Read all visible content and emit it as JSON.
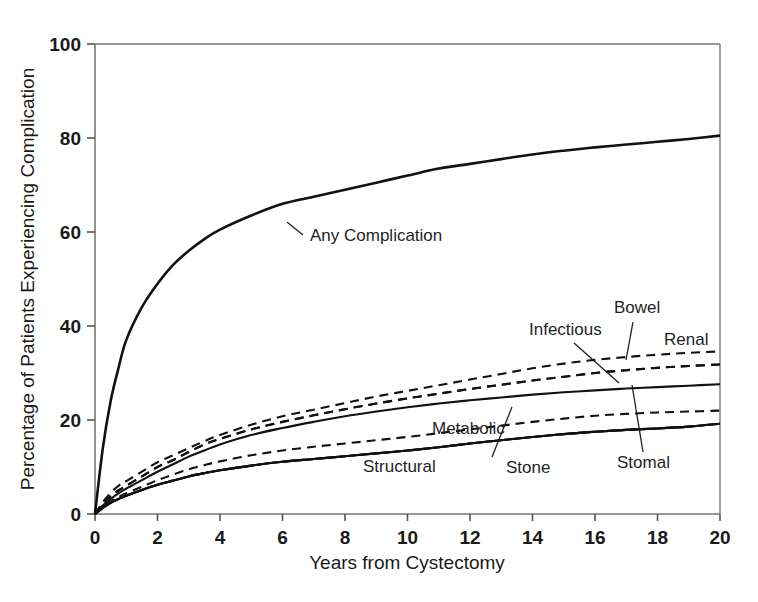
{
  "chart_data": {
    "type": "line",
    "title": "",
    "xlabel": "Years from Cystectomy",
    "ylabel": "Percentage of Patients Experiencing Complication",
    "xlim": [
      0,
      20
    ],
    "ylim": [
      0,
      100
    ],
    "xticks": [
      0,
      2,
      4,
      6,
      8,
      10,
      12,
      14,
      16,
      18,
      20
    ],
    "yticks": [
      0,
      20,
      40,
      60,
      80,
      100
    ],
    "grid": false,
    "legend": "inline-annotations",
    "x": [
      0,
      0.25,
      0.5,
      0.75,
      1,
      1.5,
      2,
      2.5,
      3,
      3.5,
      4,
      5,
      6,
      7,
      8,
      9,
      10,
      11,
      12,
      13,
      14,
      15,
      16,
      17,
      18,
      19,
      20
    ],
    "series": [
      {
        "name": "Any Complication",
        "style": "solid",
        "label": "Any Complication",
        "values": [
          0,
          14,
          24,
          31,
          37,
          44,
          49,
          53,
          56,
          58.5,
          60.5,
          63.5,
          66,
          67.5,
          69,
          70.5,
          72,
          73.5,
          74.5,
          75.5,
          76.5,
          77.3,
          78,
          78.6,
          79.2,
          79.8,
          80.5
        ]
      },
      {
        "name": "Infectious",
        "style": "dashed",
        "label": "Infectious",
        "values": [
          0,
          2.5,
          4.5,
          6,
          7,
          9,
          11,
          12.5,
          14,
          15.5,
          16.8,
          19,
          20.8,
          22.2,
          23.6,
          25,
          26.2,
          27.4,
          28.6,
          29.8,
          31,
          32,
          32.8,
          33.4,
          33.9,
          34.3,
          34.6
        ]
      },
      {
        "name": "Bowel",
        "style": "dashed",
        "label": "Bowel",
        "values": [
          0,
          2.2,
          3.8,
          5,
          6,
          8,
          10,
          11.5,
          13.2,
          14.8,
          16,
          18,
          19.6,
          21,
          22.3,
          23.5,
          24.6,
          25.6,
          26.6,
          27.5,
          28.4,
          29.2,
          30,
          30.6,
          31.1,
          31.5,
          31.8
        ]
      },
      {
        "name": "Renal",
        "style": "dashed",
        "label": "Renal",
        "values": [
          0,
          2.2,
          3.8,
          5,
          6,
          8,
          10,
          11.5,
          13.2,
          14.8,
          16,
          18,
          19.6,
          21,
          22.3,
          23.5,
          24.6,
          25.6,
          26.6,
          27.5,
          28.4,
          29.2,
          30,
          30.6,
          31.1,
          31.5,
          31.8
        ]
      },
      {
        "name": "Infectious-solid",
        "style": "solid",
        "label": "",
        "values": [
          0,
          1.8,
          3.2,
          4.4,
          5.4,
          7.2,
          9,
          10.6,
          12.2,
          13.5,
          14.8,
          16.8,
          18.3,
          19.6,
          20.8,
          21.8,
          22.7,
          23.5,
          24.2,
          24.8,
          25.4,
          25.9,
          26.3,
          26.7,
          27,
          27.3,
          27.6
        ]
      },
      {
        "name": "Metabolic",
        "style": "dashed",
        "label": "Metabolic",
        "values": [
          0,
          1.5,
          2.7,
          3.6,
          4.4,
          5.8,
          7.2,
          8.4,
          9.5,
          10.4,
          11.2,
          12.5,
          13.5,
          14.3,
          15,
          15.7,
          16.4,
          17.2,
          18,
          18.8,
          19.6,
          20.3,
          20.9,
          21.3,
          21.6,
          21.8,
          22
        ]
      },
      {
        "name": "Stone",
        "style": "solid",
        "label": "Stone",
        "values": [
          0,
          1.3,
          2.4,
          3.2,
          3.9,
          5.1,
          6.2,
          7.1,
          8,
          8.7,
          9.3,
          10.3,
          11.1,
          11.7,
          12.3,
          12.9,
          13.5,
          14.2,
          15,
          15.7,
          16.4,
          17,
          17.5,
          17.9,
          18.2,
          18.6,
          19.2
        ]
      },
      {
        "name": "Stomal",
        "style": "solid",
        "label": "Stomal",
        "values": [
          0,
          1.3,
          2.4,
          3.2,
          3.9,
          5.1,
          6.2,
          7.1,
          8,
          8.7,
          9.3,
          10.3,
          11.1,
          11.7,
          12.3,
          12.9,
          13.5,
          14.2,
          15,
          15.7,
          16.4,
          17,
          17.5,
          17.9,
          18.2,
          18.6,
          19.2
        ]
      },
      {
        "name": "Structural",
        "style": "solid",
        "label": "Structural",
        "values": [
          0,
          1.3,
          2.4,
          3.2,
          3.9,
          5.1,
          6.2,
          7.1,
          8,
          8.7,
          9.3,
          10.3,
          11.1,
          11.7,
          12.3,
          12.9,
          13.5,
          14.2,
          15,
          15.7,
          16.4,
          17,
          17.5,
          17.9,
          18.2,
          18.6,
          19.2
        ]
      }
    ],
    "annotations": [
      {
        "text": "Any Complication",
        "x_px": 310,
        "y_px": 241
      },
      {
        "text": "Infectious",
        "x_px": 529,
        "y_px": 335
      },
      {
        "text": "Bowel",
        "x_px": 614,
        "y_px": 313
      },
      {
        "text": "Renal",
        "x_px": 664,
        "y_px": 345
      },
      {
        "text": "Metabolic",
        "x_px": 432,
        "y_px": 434
      },
      {
        "text": "Structural",
        "x_px": 363,
        "y_px": 472
      },
      {
        "text": "Stone",
        "x_px": 506,
        "y_px": 473
      },
      {
        "text": "Stomal",
        "x_px": 617,
        "y_px": 468
      }
    ]
  },
  "axes": {
    "x_title": "Years from Cystectomy",
    "y_title": "Percentage of Patients Experiencing Complication",
    "x_tick_labels": [
      "0",
      "2",
      "4",
      "6",
      "8",
      "10",
      "12",
      "14",
      "16",
      "18",
      "20"
    ],
    "y_tick_labels": [
      "0",
      "20",
      "40",
      "60",
      "80",
      "100"
    ]
  },
  "colors": {
    "line": "#111111",
    "axis": "#555555",
    "text": "#1a1a1a",
    "background": "#ffffff"
  }
}
